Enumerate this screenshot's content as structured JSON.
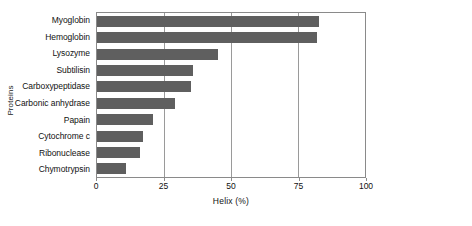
{
  "chart_data": {
    "type": "bar",
    "orientation": "horizontal",
    "title": "",
    "xlabel": "Helix (%)",
    "ylabel": "Proteins",
    "xlim": [
      0,
      100
    ],
    "xticks": [
      0,
      25,
      50,
      75,
      100
    ],
    "xtick_labels": [
      "0",
      "25",
      "50",
      "75",
      "100"
    ],
    "grid": "vertical",
    "legend": "none",
    "bar_color": "#5f5f5f",
    "categories": [
      "Myoglobin",
      "Hemoglobin",
      "Lysozyme",
      "Subtilisin",
      "Carboxypeptidase",
      "Carbonic anhydrase",
      "Papain",
      "Cytochrome c",
      "Ribonuclease",
      "Chymotrypsin"
    ],
    "values": [
      83,
      82,
      45,
      36,
      35,
      29,
      21,
      17,
      16,
      11
    ]
  }
}
